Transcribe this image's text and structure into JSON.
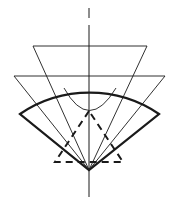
{
  "diagram": {
    "width": 177,
    "height": 197,
    "colors": {
      "background": "#ffffff",
      "stroke": "#1a1a1a"
    },
    "axis": {
      "x": 89,
      "y_top": 8,
      "y_bottom": 197,
      "dash_segments": [
        [
          8,
          18
        ],
        [
          25,
          46
        ]
      ]
    },
    "sector": {
      "apex": [
        89,
        170
      ],
      "left_corner": [
        20,
        114
      ],
      "right_corner": [
        159,
        114
      ],
      "arc_top": [
        89,
        46
      ],
      "radius": 124
    },
    "upper_triangle": {
      "points": [
        [
          33,
          46
        ],
        [
          147,
          46
        ],
        [
          89,
          170
        ]
      ]
    },
    "middle_triangle": {
      "points": [
        [
          14,
          76
        ],
        [
          165,
          76
        ],
        [
          89,
          170
        ]
      ]
    },
    "inner_arc": {
      "left": [
        64,
        88
      ],
      "bottom": [
        89,
        125
      ],
      "right": [
        116,
        88
      ]
    },
    "dashed_triangle": {
      "points": [
        [
          89,
          111
        ],
        [
          55,
          162
        ],
        [
          123,
          162
        ]
      ]
    }
  }
}
